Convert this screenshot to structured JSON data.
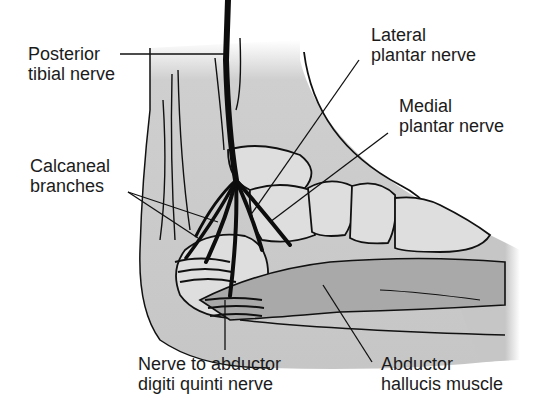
{
  "figure": {
    "colors": {
      "background": "#ffffff",
      "skin_shade": "#c9c9c9",
      "muscle_shade": "#a8a8a8",
      "bone": "#dcdcdc",
      "line": "#111111"
    }
  },
  "labels": {
    "posterior_tibial": {
      "line1": "Posterior",
      "line2": "tibial nerve"
    },
    "calcaneal": {
      "line1": "Calcaneal",
      "line2": "branches"
    },
    "lateral_plantar": {
      "line1": "Lateral",
      "line2": "plantar nerve"
    },
    "medial_plantar": {
      "line1": "Medial",
      "line2": "plantar nerve"
    },
    "abductor_digiti": {
      "line1": "Nerve to abductor",
      "line2": "digiti quinti nerve"
    },
    "abductor_hallucis": {
      "line1": "Abductor",
      "line2": "hallucis muscle"
    }
  }
}
